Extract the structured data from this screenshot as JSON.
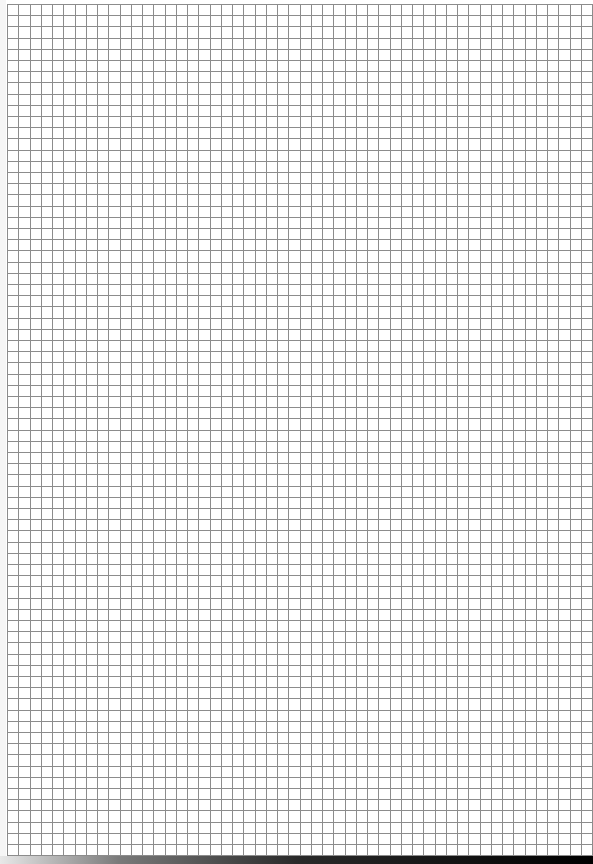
{
  "page": {
    "type": "graph-paper",
    "width": 593,
    "height": 864
  },
  "grid": {
    "origin_x": 7,
    "origin_y": 4,
    "end_x": 593,
    "end_y": 855,
    "pitch_x": 11.25,
    "pitch_y": 11.2,
    "line_width": 1,
    "line_color": "#8c8c8c",
    "background": "#ffffff"
  },
  "bottom_bar": {
    "top": 856,
    "height": 8,
    "gradient_stops": [
      "#e8e8e8",
      "#7a7a7a",
      "#2a2a2a",
      "#000000"
    ]
  }
}
